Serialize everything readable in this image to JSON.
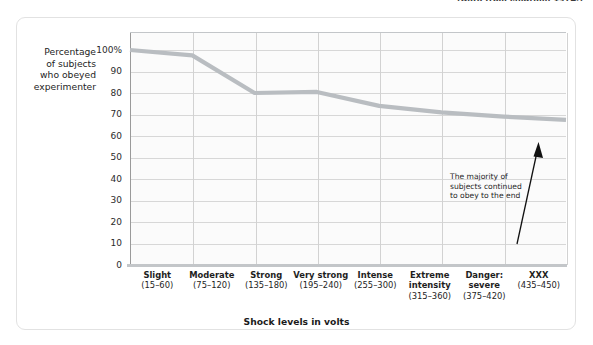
{
  "source_credit": "(Data from Milgram, 1974.)",
  "chart_data": {
    "type": "line",
    "title": "",
    "xlabel": "Shock levels in volts",
    "ylabel": "Percentage of subjects who obeyed experimenter",
    "ylabel_lines": [
      "Percentage",
      "of subjects",
      "who obeyed",
      "experimenter"
    ],
    "ylim": [
      0,
      100
    ],
    "yticks": [
      "100%",
      "90",
      "80",
      "70",
      "60",
      "50",
      "40",
      "30",
      "20",
      "10",
      "0"
    ],
    "ytick_values": [
      100,
      90,
      80,
      70,
      60,
      50,
      40,
      30,
      20,
      10,
      0
    ],
    "grid": true,
    "legend": "none",
    "categories": [
      "Slight",
      "Moderate",
      "Strong",
      "Very strong",
      "Intense",
      "Extreme intensity",
      "Danger: severe",
      "XXX"
    ],
    "category_labels": [
      {
        "name": "Slight",
        "range": "(15–60)"
      },
      {
        "name": "Moderate",
        "range": "(75–120)"
      },
      {
        "name": "Strong",
        "range": "(135–180)"
      },
      {
        "name": "Very strong",
        "range": "(195–240)"
      },
      {
        "name": "Intense",
        "range": "(255–300)"
      },
      {
        "name": "Extreme intensity",
        "range": "(315–360)"
      },
      {
        "name": "Danger: severe",
        "range": "(375–420)"
      },
      {
        "name": "XXX",
        "range": "(435–450)"
      }
    ],
    "values": [
      100,
      97.5,
      80,
      80.5,
      74,
      71,
      69,
      67.5
    ],
    "series": [
      {
        "name": "Percentage obeying",
        "values": [
          100,
          97.5,
          80,
          80.5,
          74,
          71,
          69,
          67.5
        ],
        "color": "#b9bdc1"
      }
    ],
    "annotations": [
      {
        "text": "The majority of subjects continued to obey to the end",
        "lines": [
          "The majority of",
          "subjects continued",
          "to obey to the end"
        ],
        "arrow": "up-right"
      }
    ]
  },
  "colors": {
    "line": "#b9bdc1",
    "grid": "#d7d7d7",
    "axis": "#9a9a9a",
    "plot_bg": "#fbfbfb",
    "card_border": "#e2e2e2",
    "text": "#1e1e1e"
  }
}
